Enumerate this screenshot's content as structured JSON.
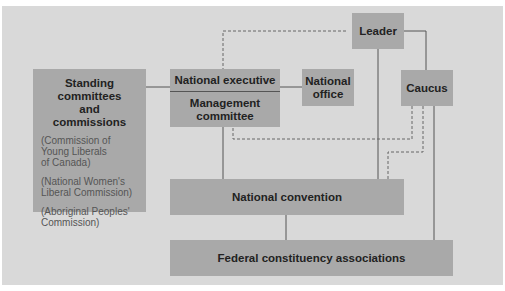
{
  "diagram": {
    "nodes": {
      "leader": {
        "label": "Leader"
      },
      "caucus": {
        "label": "Caucus"
      },
      "national_office": {
        "label": "National office"
      },
      "national_executive": {
        "label": "National executive"
      },
      "management_committee": {
        "label": "Management committee"
      },
      "national_convention": {
        "label": "National convention"
      },
      "federal_constituency_associations": {
        "label": "Federal constituency associations"
      },
      "standing_committees": {
        "label": "Standing committees and commissions",
        "items": [
          "(Commission of Young Liberals of Canada)",
          "(National Women's Liberal Commission)",
          "(Aboriginal Peoples' Commission)"
        ]
      }
    },
    "edges": [
      {
        "from": "leader",
        "to": "national_executive",
        "style": "dashed"
      },
      {
        "from": "leader",
        "to": "caucus",
        "style": "solid"
      },
      {
        "from": "leader",
        "to": "national_convention",
        "style": "solid"
      },
      {
        "from": "caucus",
        "to": "management_committee",
        "style": "dashed"
      },
      {
        "from": "caucus",
        "to": "national_convention",
        "style": "dashed"
      },
      {
        "from": "caucus",
        "to": "federal_constituency_associations",
        "style": "solid"
      },
      {
        "from": "management_committee",
        "to": "national_convention",
        "style": "solid"
      },
      {
        "from": "national_executive",
        "to": "national_office",
        "style": "solid"
      },
      {
        "from": "standing_committees",
        "to": "national_executive",
        "style": "solid"
      },
      {
        "from": "national_convention",
        "to": "federal_constituency_associations",
        "style": "solid"
      }
    ]
  }
}
